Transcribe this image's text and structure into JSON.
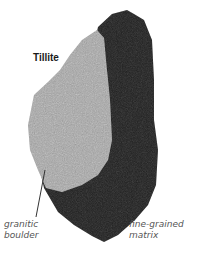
{
  "title": "Tillite",
  "labels": {
    "granite_line1": "granitic",
    "granite_line2": "boulder",
    "matrix_line1": "fine-grained",
    "matrix_line2": "matrix"
  },
  "colors": {
    "matrix": "#1c1c1c",
    "granite": "#a8a8a8"
  }
}
